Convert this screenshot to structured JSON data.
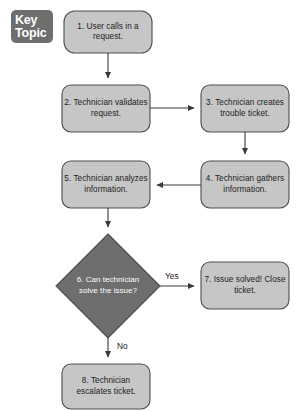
{
  "badge": {
    "line1": "Key",
    "line2": "Topic"
  },
  "colors": {
    "process_fill": "#c6c6c6",
    "process_stroke": "#4d4d4d",
    "decision_fill": "#6e6e6e",
    "decision_stroke": "#4d4d4d",
    "connector": "#3a3a3a",
    "badge_fill": "#6e6e6e",
    "text": "#1c1c1c",
    "decision_text": "#ffffff",
    "background": "#ffffff"
  },
  "diagram": {
    "type": "flowchart",
    "title": "Key Topic",
    "nodes": [
      {
        "id": "n1",
        "number": "1.",
        "shape": "rounded-rectangle",
        "text": "1. User calls in a request.",
        "x": 64,
        "y": 11,
        "w": 88,
        "h": 42
      },
      {
        "id": "n2",
        "number": "2.",
        "shape": "rounded-rectangle",
        "text": "2. Technician validates request.",
        "x": 62,
        "y": 85,
        "w": 88,
        "h": 47
      },
      {
        "id": "n3",
        "number": "3.",
        "shape": "rounded-rectangle",
        "text": "3. Technician creates trouble ticket.",
        "x": 201,
        "y": 85,
        "w": 88,
        "h": 47
      },
      {
        "id": "n4",
        "number": "4.",
        "shape": "rounded-rectangle",
        "text": "4. Technician gathers information.",
        "x": 201,
        "y": 161,
        "w": 88,
        "h": 47
      },
      {
        "id": "n5",
        "number": "5.",
        "shape": "rounded-rectangle",
        "text": "5. Technician analyzes information.",
        "x": 62,
        "y": 161,
        "w": 88,
        "h": 47
      },
      {
        "id": "n6",
        "number": "6.",
        "shape": "diamond",
        "text": "6. Can technician solve the issue?",
        "x": 56,
        "y": 234,
        "w": 104,
        "h": 104
      },
      {
        "id": "n7",
        "number": "7.",
        "shape": "rounded-rectangle",
        "text": "7. Issue solved! Close ticket.",
        "x": 201,
        "y": 262,
        "w": 88,
        "h": 47
      },
      {
        "id": "n8",
        "number": "8.",
        "shape": "rounded-rectangle",
        "text": "8. Technician escalates ticket.",
        "x": 62,
        "y": 364,
        "w": 88,
        "h": 45
      }
    ],
    "edges": [
      {
        "id": "e1",
        "from": "n1",
        "to": "n2",
        "label": ""
      },
      {
        "id": "e2",
        "from": "n2",
        "to": "n3",
        "label": ""
      },
      {
        "id": "e3",
        "from": "n3",
        "to": "n4",
        "label": ""
      },
      {
        "id": "e4",
        "from": "n4",
        "to": "n5",
        "label": ""
      },
      {
        "id": "e5",
        "from": "n5",
        "to": "n6",
        "label": ""
      },
      {
        "id": "e6",
        "from": "n6",
        "to": "n7",
        "label": "Yes"
      },
      {
        "id": "e7",
        "from": "n6",
        "to": "n8",
        "label": "No"
      }
    ],
    "edge_labels": {
      "yes": "Yes",
      "no": "No"
    }
  }
}
